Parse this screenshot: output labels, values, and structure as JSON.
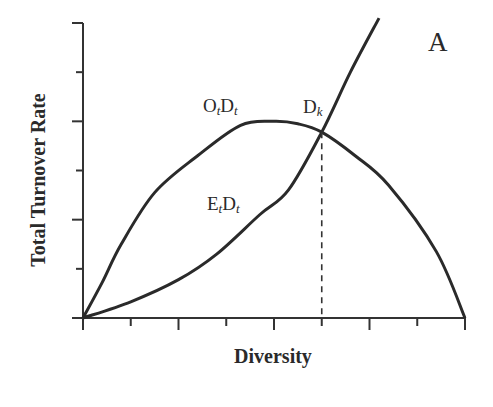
{
  "chart_data": {
    "type": "line",
    "title": "",
    "panel_label": "A",
    "xlabel": "Diversity",
    "ylabel": "Total Turnover Rate",
    "x_ticks": {
      "count": 9,
      "labels": []
    },
    "y_ticks": {
      "count": 7,
      "labels": []
    },
    "grid": false,
    "legend": "none (inline curve labels)",
    "xlim": [
      0,
      8
    ],
    "ylim": [
      0,
      6
    ],
    "series": [
      {
        "name": "OtDt",
        "label_main": [
          "O",
          "D"
        ],
        "label_sub": [
          "t",
          "t"
        ],
        "shape": "hump (rises, peaks, falls to zero)",
        "x": [
          0,
          0.4,
          0.8,
          1.5,
          2.4,
          3.3,
          4.0,
          4.5,
          5.0,
          5.7,
          6.4,
          7.4,
          8.0
        ],
        "y": [
          0,
          0.72,
          1.5,
          2.55,
          3.3,
          3.92,
          4.0,
          3.95,
          3.78,
          3.3,
          2.7,
          1.35,
          0
        ]
      },
      {
        "name": "EtDt",
        "label_main": [
          "E",
          "D"
        ],
        "label_sub": [
          "t",
          "t"
        ],
        "shape": "convex increasing",
        "x": [
          0,
          1.0,
          2.0,
          2.8,
          3.7,
          4.3,
          5.0,
          5.6,
          6.2
        ],
        "y": [
          0,
          0.33,
          0.78,
          1.3,
          2.1,
          2.6,
          3.78,
          5.0,
          6.1
        ]
      }
    ],
    "annotations": [
      {
        "text": "D",
        "sub": "k",
        "type": "intersection",
        "x": 5.0,
        "y": 3.78,
        "dropline": "dashed vertical to x-axis"
      }
    ]
  }
}
